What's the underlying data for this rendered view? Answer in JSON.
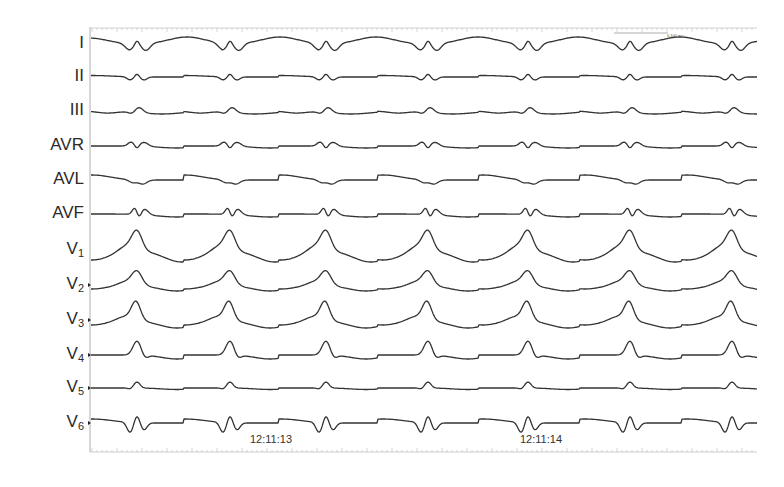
{
  "chart_data": {
    "type": "line",
    "title": "",
    "xlabel": "",
    "ylabel": "",
    "subtitle": "12-lead ECG strip",
    "time_labels": [
      {
        "label": "12:11:13",
        "x_px": 250
      },
      {
        "label": "12:11:14",
        "x_px": 520
      }
    ],
    "scale_bar": {
      "label": "0.100 ms"
    },
    "beat_positions_px": [
      137,
      230,
      326,
      428,
      528,
      630,
      732
    ],
    "rr_interval_px_approx": 100,
    "leads": [
      {
        "name": "I",
        "sub": "",
        "baseline_y": 44,
        "morphology": "biphasic rS small QRS, broad T/U wave between beats"
      },
      {
        "name": "II",
        "sub": "",
        "baseline_y": 77,
        "morphology": "low amplitude, small biphasic complexes"
      },
      {
        "name": "III",
        "sub": "",
        "baseline_y": 111,
        "morphology": "low amplitude, small positive deflections"
      },
      {
        "name": "AVR",
        "sub": "",
        "baseline_y": 146,
        "morphology": "low amplitude biphasic"
      },
      {
        "name": "AVL",
        "sub": "",
        "baseline_y": 180,
        "morphology": "low amplitude, broad undulation"
      },
      {
        "name": "AVF",
        "sub": "",
        "baseline_y": 214,
        "morphology": "small sharp positive/negative complexes"
      },
      {
        "name": "V",
        "sub": "1",
        "baseline_y": 250,
        "morphology": "tall peaked complexes with deep troughs between beats"
      },
      {
        "name": "V",
        "sub": "2",
        "baseline_y": 285,
        "morphology": "peaked complexes, moderate troughs"
      },
      {
        "name": "V",
        "sub": "3",
        "baseline_y": 320,
        "morphology": "tall peaked complexes, troughs between beats"
      },
      {
        "name": "V",
        "sub": "4",
        "baseline_y": 355,
        "morphology": "rounded peaks, flat baseline"
      },
      {
        "name": "V",
        "sub": "5",
        "baseline_y": 388,
        "morphology": "small positive bumps, flat baseline"
      },
      {
        "name": "V",
        "sub": "6",
        "baseline_y": 423,
        "morphology": "negative W-shaped QRS complexes"
      }
    ],
    "grid": false,
    "legend": "none"
  },
  "colors": {
    "trace": "#333333",
    "axis": "#9a9a9a",
    "label": "#2a2a2a",
    "background": "#ffffff"
  }
}
